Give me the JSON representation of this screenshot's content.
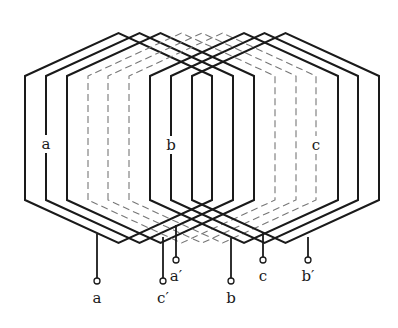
{
  "diagram": {
    "type": "three-phase concentric winding diagram",
    "pitch_slots": 9,
    "slot_x": [
      25,
      46,
      67,
      88,
      108,
      129,
      150,
      171,
      192,
      212,
      233,
      254,
      275,
      296,
      316,
      338,
      358,
      379
    ],
    "geometry": {
      "apex_y": 33,
      "top_shoulder_y": 76,
      "bottom_shoulder_y": 200,
      "bottom_vertex_y": 243
    },
    "colors": {
      "line": "#1a1a1a",
      "dashed": "#777777"
    },
    "coil_groups": [
      {
        "phase": "a",
        "style": "solid",
        "left_slots": [
          0,
          1,
          2
        ]
      },
      {
        "phase": "c",
        "style": "dashed",
        "left_slots": [
          3,
          4,
          5
        ]
      },
      {
        "phase": "b",
        "style": "solid",
        "left_slots": [
          6,
          7,
          8
        ]
      }
    ],
    "phase_labels": [
      {
        "text": "a",
        "x": 46,
        "y": 149
      },
      {
        "text": "b",
        "x": 171,
        "y": 150
      },
      {
        "text": "c",
        "x": 316,
        "y": 150
      }
    ],
    "leads": [
      {
        "text": "a",
        "x": 97,
        "y_top": 234,
        "terminal_y": 281,
        "label_y": 303
      },
      {
        "text": "c′",
        "x": 163,
        "y_top": 237,
        "terminal_y": 281,
        "label_y": 303
      },
      {
        "text": "a′",
        "x": 176,
        "y_top": 225,
        "terminal_y": 260,
        "label_y": 281
      },
      {
        "text": "b",
        "x": 231,
        "y_top": 238,
        "terminal_y": 281,
        "label_y": 303
      },
      {
        "text": "c",
        "x": 263,
        "y_top": 233,
        "terminal_y": 260,
        "label_y": 281
      },
      {
        "text": "b′",
        "x": 308,
        "y_top": 237,
        "terminal_y": 260,
        "label_y": 281
      }
    ]
  }
}
